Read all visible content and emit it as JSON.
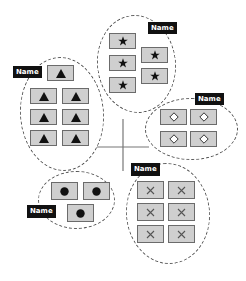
{
  "diagram": {
    "background": "#ffffff",
    "box_fill": "#cfcfcf",
    "box_border": "#6b6b6b",
    "label_bg": "#111111",
    "label_fg": "#ffffff",
    "groups": [
      {
        "id": "stars",
        "label": "Name",
        "symbol": "star",
        "count": 5
      },
      {
        "id": "triangles",
        "label": "Name",
        "symbol": "triangle",
        "count": 7
      },
      {
        "id": "diamonds",
        "label": "Name",
        "symbol": "diamond",
        "count": 4
      },
      {
        "id": "circles",
        "label": "Name",
        "symbol": "circle",
        "count": 3
      },
      {
        "id": "crosses",
        "label": "Name",
        "symbol": "cross",
        "count": 6
      }
    ]
  }
}
